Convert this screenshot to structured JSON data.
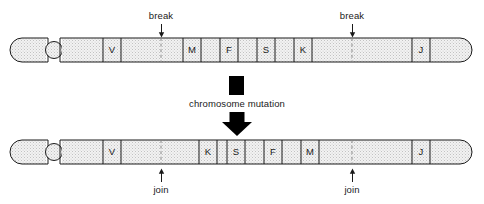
{
  "diagram": {
    "process_label": "chromosome mutation",
    "break_label_left": "break",
    "break_label_right": "break",
    "join_label_left": "join",
    "join_label_right": "join",
    "colors": {
      "outline": "#1a1a1a",
      "band_fill": "#ebebeb",
      "stipple": "#bdbdbd",
      "arrow_black": "#000000",
      "text": "#1a1a1a",
      "dashed_marker": "#6e6e6e"
    },
    "top_chromosome": {
      "name": "original chromosome",
      "labelled_bands": [
        "V",
        "M",
        "F",
        "S",
        "K",
        "J"
      ],
      "break_points": 2
    },
    "bottom_chromosome": {
      "name": "mutated chromosome",
      "labelled_bands": [
        "V",
        "K",
        "S",
        "F",
        "M",
        "J"
      ],
      "join_points": 2
    },
    "mutation_type": "inversion"
  }
}
